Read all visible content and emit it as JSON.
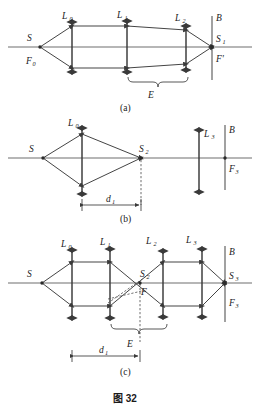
{
  "figure": {
    "caption": "图 32",
    "panels": [
      {
        "id": "a",
        "tag": "(a)",
        "labels": {
          "source": "S",
          "source_focus": "F",
          "source_focus_sub": "0",
          "lens0": "L",
          "lens0_sub": "0",
          "lens1": "L",
          "lens1_sub": "1",
          "lens2": "L",
          "lens2_sub": "2",
          "screen": "B",
          "image": "S",
          "image_sub": "1",
          "focus_prime": "F'",
          "brace": "E"
        }
      },
      {
        "id": "b",
        "tag": "(b)",
        "labels": {
          "source": "S",
          "lens0": "L",
          "lens0_sub": "0",
          "image2": "S",
          "image2_sub": "2",
          "lens3": "L",
          "lens3_sub": "3",
          "screen": "B",
          "focus3": "F",
          "focus3_sub": "3",
          "dim": "d",
          "dim_sub": "1"
        }
      },
      {
        "id": "c",
        "tag": "(c)",
        "labels": {
          "source": "S",
          "lens0": "L",
          "lens0_sub": "0",
          "lens1": "L",
          "lens1_sub": "1",
          "lens2": "L",
          "lens2_sub": "2",
          "lens3": "L",
          "lens3_sub": "3",
          "screen": "B",
          "image2": "S",
          "image2_sub": "2",
          "focus": "F",
          "image3": "S",
          "image3_sub": "3",
          "focus3": "F",
          "focus3_sub": "3",
          "brace": "E",
          "dim": "d",
          "dim_sub": "1"
        }
      }
    ]
  },
  "colors": {
    "ink": "#1a1a1a",
    "ray": "#3a3a3a",
    "axis": "#6e6e6e",
    "background": "#ffffff"
  }
}
